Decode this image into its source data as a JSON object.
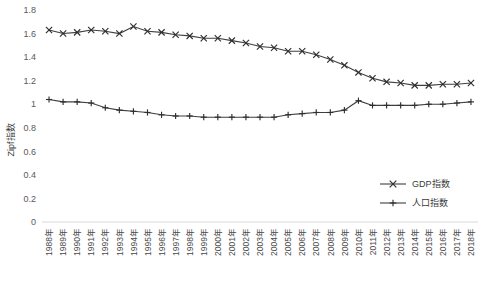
{
  "chart_data": {
    "type": "line",
    "title": "",
    "xlabel": "",
    "ylabel": "Zipf指数",
    "ylim": [
      0,
      1.8
    ],
    "yticks": [
      "0",
      "0.2",
      "0.4",
      "0.6",
      "0.8",
      "1",
      "1.2",
      "1.4",
      "1.6",
      "1.8"
    ],
    "ytick_values": [
      0,
      0.2,
      0.4,
      0.6,
      0.8,
      1.0,
      1.2,
      1.4,
      1.6,
      1.8
    ],
    "grid": false,
    "legend_position": "inside-bottom-right",
    "categories": [
      "1988年",
      "1989年",
      "1990年",
      "1991年",
      "1992年",
      "1993年",
      "1994年",
      "1995年",
      "1996年",
      "1997年",
      "1998年",
      "1999年",
      "2000年",
      "2001年",
      "2002年",
      "2003年",
      "2004年",
      "2005年",
      "2006年",
      "2007年",
      "2008年",
      "2009年",
      "2010年",
      "2011年",
      "2012年",
      "2013年",
      "2014年",
      "2015年",
      "2016年",
      "2017年",
      "2018年"
    ],
    "series": [
      {
        "name": "GDP指数",
        "marker": "x",
        "values": [
          1.63,
          1.6,
          1.61,
          1.63,
          1.62,
          1.6,
          1.66,
          1.62,
          1.61,
          1.59,
          1.58,
          1.56,
          1.56,
          1.54,
          1.52,
          1.49,
          1.48,
          1.45,
          1.45,
          1.42,
          1.38,
          1.33,
          1.27,
          1.22,
          1.19,
          1.18,
          1.16,
          1.16,
          1.17,
          1.17,
          1.18
        ]
      },
      {
        "name": "人口指数",
        "marker": "+",
        "values": [
          1.04,
          1.02,
          1.02,
          1.01,
          0.97,
          0.95,
          0.94,
          0.93,
          0.91,
          0.9,
          0.9,
          0.89,
          0.89,
          0.89,
          0.89,
          0.89,
          0.89,
          0.91,
          0.92,
          0.93,
          0.93,
          0.95,
          1.03,
          0.99,
          0.99,
          0.99,
          0.99,
          1.0,
          1.0,
          1.01,
          1.02
        ]
      }
    ]
  },
  "legend": {
    "items": [
      {
        "label": "GDP指数",
        "marker": "x"
      },
      {
        "label": "人口指数",
        "marker": "+"
      }
    ]
  }
}
